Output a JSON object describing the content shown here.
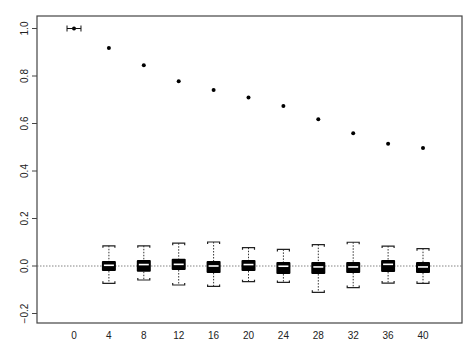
{
  "chart_data": {
    "type": "scatter+boxplot",
    "title": "",
    "xlabel": "",
    "ylabel": "",
    "xlim": [
      -4,
      46
    ],
    "ylim": [
      -0.25,
      1.05
    ],
    "grid": false,
    "legend": null,
    "x_ticks": [
      0,
      4,
      8,
      12,
      16,
      20,
      24,
      28,
      32,
      36,
      40
    ],
    "y_ticks": [
      1.0,
      0.8,
      0.6,
      0.4,
      0.2,
      0.0,
      -0.2
    ],
    "y_tick_labels": [
      "1.0",
      "0.8",
      "0.6",
      "0.4",
      "0.2",
      "0.0",
      "−0.2"
    ],
    "x_tick_labels": [
      "0",
      "4",
      "8",
      "12",
      "16",
      "20",
      "24",
      "28",
      "32",
      "36",
      "40"
    ],
    "reference_line": {
      "y": 0.0,
      "style": "dotted"
    },
    "points": {
      "name": "autocorrelation",
      "x": [
        0,
        4,
        8,
        12,
        16,
        20,
        24,
        28,
        32,
        36,
        40
      ],
      "y": [
        1.0,
        0.918,
        0.845,
        0.778,
        0.741,
        0.71,
        0.674,
        0.618,
        0.559,
        0.515,
        0.497
      ],
      "x_error_at_0": [
        -0.8,
        0.8
      ]
    },
    "boxplots": [
      {
        "x": 4,
        "whisker_low": -0.073,
        "q1": -0.021,
        "median": 0.003,
        "q3": 0.021,
        "whisker_high": 0.085
      },
      {
        "x": 8,
        "whisker_low": -0.059,
        "q1": -0.024,
        "median": 0.006,
        "q3": 0.025,
        "whisker_high": 0.085
      },
      {
        "x": 12,
        "whisker_low": -0.08,
        "q1": -0.017,
        "median": 0.007,
        "q3": 0.031,
        "whisker_high": 0.096
      },
      {
        "x": 16,
        "whisker_low": -0.086,
        "q1": -0.029,
        "median": 0.0,
        "q3": 0.021,
        "whisker_high": 0.101
      },
      {
        "x": 20,
        "whisker_low": -0.066,
        "q1": -0.021,
        "median": 0.006,
        "q3": 0.025,
        "whisker_high": 0.077
      },
      {
        "x": 24,
        "whisker_low": -0.069,
        "q1": -0.034,
        "median": -0.001,
        "q3": 0.017,
        "whisker_high": 0.07
      },
      {
        "x": 28,
        "whisker_low": -0.111,
        "q1": -0.034,
        "median": -0.004,
        "q3": 0.017,
        "whisker_high": 0.09
      },
      {
        "x": 32,
        "whisker_low": -0.091,
        "q1": -0.029,
        "median": -0.004,
        "q3": 0.017,
        "whisker_high": 0.1
      },
      {
        "x": 36,
        "whisker_low": -0.072,
        "q1": -0.025,
        "median": 0.007,
        "q3": 0.025,
        "whisker_high": 0.084
      },
      {
        "x": 40,
        "whisker_low": -0.073,
        "q1": -0.029,
        "median": -0.004,
        "q3": 0.017,
        "whisker_high": 0.073
      }
    ]
  },
  "colors": {
    "axis": "#444444",
    "point": "#000000",
    "box_fill": "#000000",
    "median": "#ffffff",
    "reference_line": "#666666"
  }
}
